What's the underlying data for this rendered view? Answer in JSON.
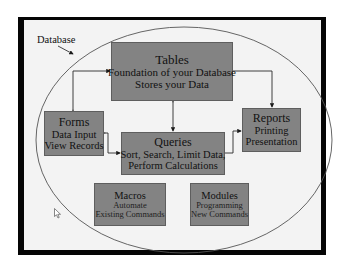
{
  "diagram": {
    "container_label": "Database",
    "boxes": {
      "tables": {
        "title": "Tables",
        "lines": [
          "Foundation of your Database",
          "Stores your Data"
        ]
      },
      "forms": {
        "title": "Forms",
        "lines": [
          "Data Input",
          "View Records"
        ]
      },
      "queries": {
        "title": "Queries",
        "lines": [
          "Sort, Search, Limit Data,",
          "Perform Calculations"
        ]
      },
      "reports": {
        "title": "Reports",
        "lines": [
          "Printing",
          "Presentation"
        ]
      },
      "macros": {
        "title": "Macros",
        "lines": [
          "Automate",
          "Existing Commands"
        ]
      },
      "modules": {
        "title": "Modules",
        "lines": [
          "Programming",
          "New Commands"
        ]
      }
    },
    "connections": [
      {
        "from": "tables",
        "to": "forms",
        "bidirectional": true
      },
      {
        "from": "tables",
        "to": "queries",
        "bidirectional": true
      },
      {
        "from": "tables",
        "to": "reports",
        "bidirectional": false
      },
      {
        "from": "forms",
        "to": "queries",
        "bidirectional": true
      },
      {
        "from": "queries",
        "to": "reports",
        "bidirectional": false
      }
    ],
    "colors": {
      "box_fill": "#838383",
      "background": "#f3f3f3",
      "frame": "#050505",
      "line": "#2a2a2a"
    },
    "cursor_icon": "mouse-pointer-arrow"
  }
}
